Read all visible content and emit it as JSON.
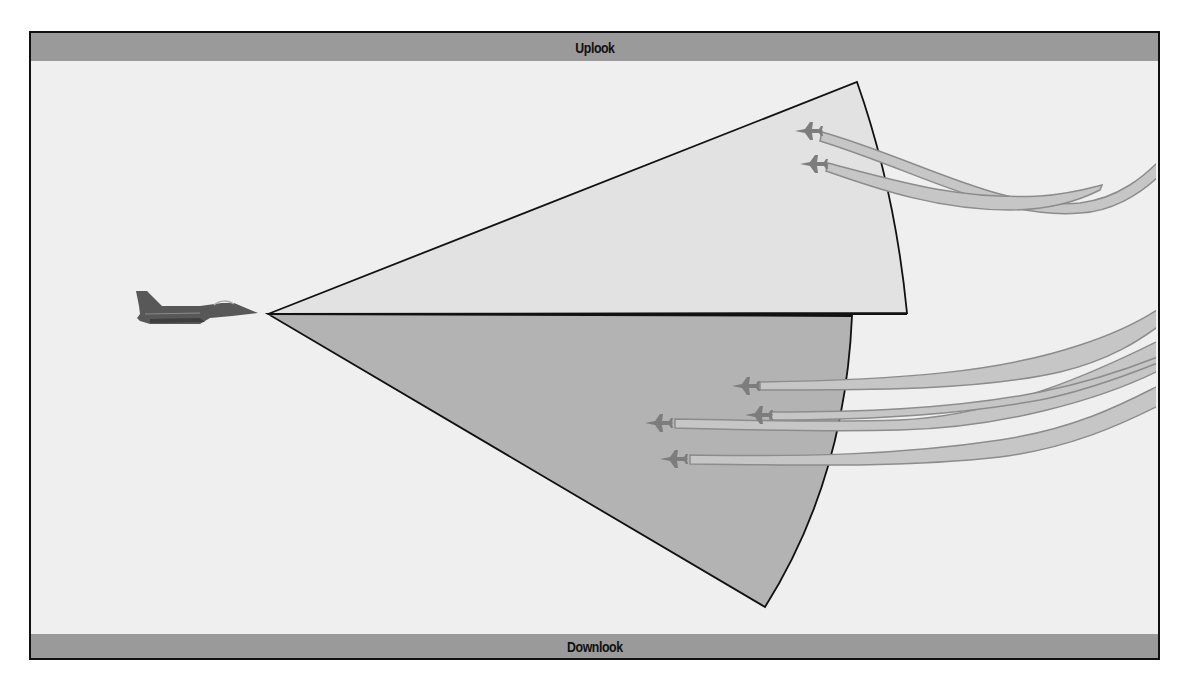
{
  "diagram": {
    "top_label": "Uplook",
    "bottom_label": "Downlook",
    "colors": {
      "frame_border": "#111111",
      "background": "#efefef",
      "label_bar": "#9a9a9a",
      "uplook_cone": "#e2e2e2",
      "downlook_cone": "#b3b3b3",
      "trail_fill": "#c6c6c6",
      "trail_edge": "#8c8c8c",
      "target_aircraft": "#7d7d7d",
      "fighter": "#555555"
    },
    "elements": {
      "radar_aircraft": "fighter-jet-icon",
      "uplook_targets": 2,
      "downlook_targets": 4
    }
  }
}
